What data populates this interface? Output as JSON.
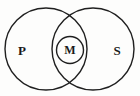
{
  "figure": {
    "name": "venn-diagram",
    "type": "venn",
    "background_color": "#fdfdfc",
    "stroke_color": "#1f1f1f",
    "stroke_width": 1.4,
    "width": 140,
    "height": 96
  },
  "shapes": {
    "left_circle": {
      "name": "circle-p",
      "cx": 46,
      "cy": 49,
      "r": 41
    },
    "right_circle": {
      "name": "circle-s",
      "cx": 93,
      "cy": 49,
      "r": 41
    },
    "inner_circle": {
      "name": "circle-m",
      "cx": 70,
      "cy": 50,
      "r": 13.5
    }
  },
  "labels": {
    "left": {
      "text": "P",
      "x": 22,
      "y": 50,
      "font_size": 13
    },
    "middle": {
      "text": "M",
      "x": 70,
      "y": 50,
      "font_size": 12
    },
    "right": {
      "text": "S",
      "x": 117,
      "y": 50,
      "font_size": 13
    }
  }
}
